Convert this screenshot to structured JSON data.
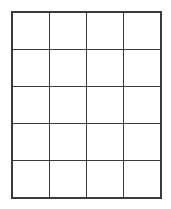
{
  "figure": {
    "name": "blank-grid",
    "type": "grid",
    "rows": 5,
    "columns": 4,
    "total_cells": 20,
    "line_color": "#3b3b3b",
    "cell_fill_color": "#ffffff",
    "background_color": "#ffffff",
    "outer_border_width_px": 2,
    "inner_line_width_px": 1,
    "grid_left_px": 11,
    "grid_top_px": 11,
    "grid_width_px": 151,
    "grid_height_px": 188,
    "cell_width_px": 37.75,
    "cell_height_px": 37.6
  },
  "cells": [
    [
      {
        "row": 1,
        "col": 1,
        "text": ""
      },
      {
        "row": 1,
        "col": 2,
        "text": ""
      },
      {
        "row": 1,
        "col": 3,
        "text": ""
      },
      {
        "row": 1,
        "col": 4,
        "text": ""
      }
    ],
    [
      {
        "row": 2,
        "col": 1,
        "text": ""
      },
      {
        "row": 2,
        "col": 2,
        "text": ""
      },
      {
        "row": 2,
        "col": 3,
        "text": ""
      },
      {
        "row": 2,
        "col": 4,
        "text": ""
      }
    ],
    [
      {
        "row": 3,
        "col": 1,
        "text": ""
      },
      {
        "row": 3,
        "col": 2,
        "text": ""
      },
      {
        "row": 3,
        "col": 3,
        "text": ""
      },
      {
        "row": 3,
        "col": 4,
        "text": ""
      }
    ],
    [
      {
        "row": 4,
        "col": 1,
        "text": ""
      },
      {
        "row": 4,
        "col": 2,
        "text": ""
      },
      {
        "row": 4,
        "col": 3,
        "text": ""
      },
      {
        "row": 4,
        "col": 4,
        "text": ""
      }
    ],
    [
      {
        "row": 5,
        "col": 1,
        "text": ""
      },
      {
        "row": 5,
        "col": 2,
        "text": ""
      },
      {
        "row": 5,
        "col": 3,
        "text": ""
      },
      {
        "row": 5,
        "col": 4,
        "text": ""
      }
    ]
  ]
}
